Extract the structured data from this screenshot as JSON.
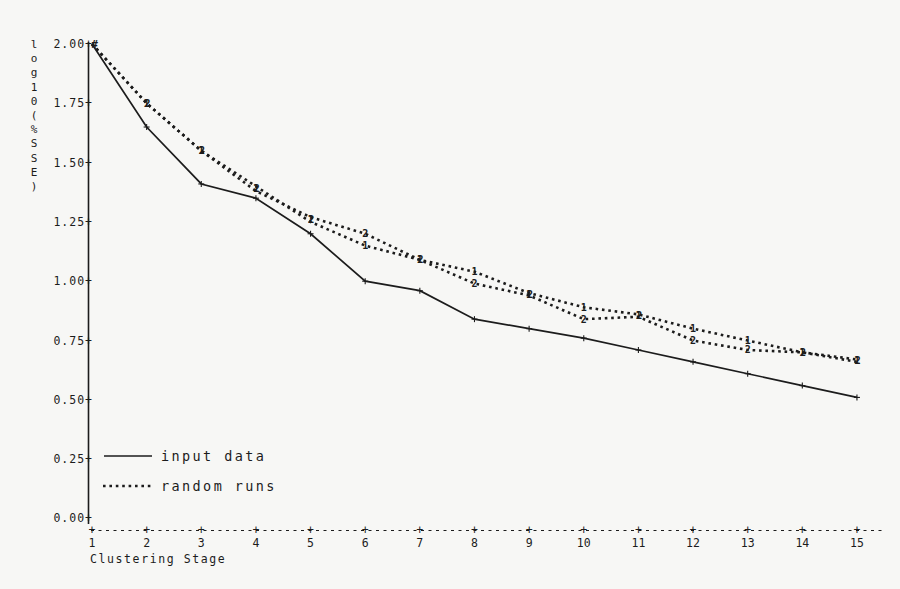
{
  "page": {
    "background": "#f7f7f5",
    "ink": "#1c1c1c"
  },
  "chart_data": {
    "type": "line",
    "title": "",
    "xlabel": "Clustering Stage",
    "ylabel": "log10(%SSE)",
    "x": [
      1,
      2,
      3,
      4,
      5,
      6,
      7,
      8,
      9,
      10,
      11,
      12,
      13,
      14,
      15
    ],
    "x_tick_labels": [
      "1",
      "2",
      "3",
      "4",
      "5",
      "6",
      "7",
      "8",
      "9",
      "10",
      "11",
      "12",
      "13",
      "14",
      "15"
    ],
    "ylim": [
      0.0,
      2.0
    ],
    "y_ticks": [
      0.0,
      0.25,
      0.5,
      0.75,
      1.0,
      1.25,
      1.5,
      1.75,
      2.0
    ],
    "y_tick_labels": [
      "0.00+",
      "0.25+",
      "0.50+",
      "0.75+",
      "1.00+",
      "1.25+",
      "1.50+",
      "1.75+",
      "2.00+"
    ],
    "grid": false,
    "legend_position": "lower-left",
    "origin_overlap_marker": "#",
    "series": [
      {
        "name": "input data",
        "line": "solid",
        "marker": "+",
        "values": [
          2.0,
          1.65,
          1.41,
          1.35,
          1.2,
          1.0,
          0.96,
          0.84,
          0.8,
          0.76,
          0.71,
          0.66,
          0.61,
          0.56,
          0.51
        ]
      },
      {
        "name": "random run 1",
        "line": "dotted",
        "marker": "1",
        "values": [
          2.0,
          1.75,
          1.55,
          1.4,
          1.25,
          1.15,
          1.09,
          1.04,
          0.95,
          0.89,
          0.86,
          0.8,
          0.75,
          0.7,
          0.67
        ]
      },
      {
        "name": "random run 2",
        "line": "dotted",
        "marker": "2",
        "values": [
          2.0,
          1.75,
          1.55,
          1.38,
          1.27,
          1.2,
          1.09,
          0.99,
          0.94,
          0.84,
          0.85,
          0.75,
          0.71,
          0.7,
          0.66
        ]
      }
    ],
    "legend": [
      {
        "label": "input data",
        "style": "solid"
      },
      {
        "label": "random runs",
        "style": "dotted"
      }
    ]
  }
}
